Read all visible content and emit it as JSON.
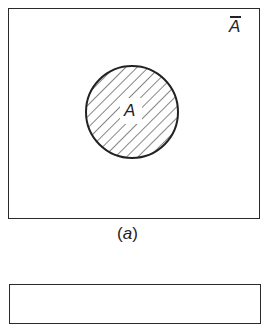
{
  "figure": {
    "panels": [
      {
        "id": "a",
        "caption": "a",
        "caption_open": "(",
        "caption_close": ")",
        "set_label": "A",
        "complement_label": "A",
        "complement_has_overbar": true,
        "set_shaded": true,
        "shading": "diagonal-hatch"
      },
      {
        "id": "b",
        "partially_visible": true
      }
    ],
    "colors": {
      "line": "#2a2a2a",
      "background": "#ffffff"
    }
  }
}
